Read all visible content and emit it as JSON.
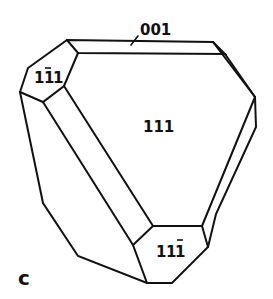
{
  "figure": {
    "panel_label": "c",
    "faces": [
      {
        "id": "face-111",
        "index": "111",
        "label_parts": [
          "1",
          "1",
          "1"
        ],
        "bar_over": null
      },
      {
        "id": "face-1-11",
        "index": "1¯11",
        "label_parts": [
          "1",
          "1",
          "1"
        ],
        "bar_over": 1,
        "display": "1ī1"
      },
      {
        "id": "face-11-1",
        "index": "11¯1",
        "label_parts": [
          "1",
          "1",
          "1"
        ],
        "bar_over": 2,
        "display": "11ī"
      },
      {
        "id": "face-001",
        "index": "001",
        "display": "001"
      }
    ],
    "labels": {
      "face_111": "111",
      "face_1m11_a": "1",
      "face_1m11_b": "1",
      "face_1m11_c": "1",
      "face_11m1_a": "1",
      "face_11m1_b": "1",
      "face_11m1_c": "1",
      "face_001": "001"
    },
    "colors": {
      "line": "#111111",
      "background": "#ffffff"
    }
  }
}
